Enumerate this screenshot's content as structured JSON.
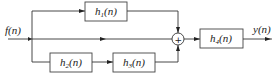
{
  "diagram": {
    "type": "block-diagram",
    "input": {
      "label": "f(n)",
      "name": "f",
      "arg": "(n)"
    },
    "output": {
      "label": "y(n)",
      "name": "y",
      "arg": "(n)"
    },
    "blocks": [
      {
        "id": "h1",
        "label": "h1(n)",
        "name": "h",
        "sub": "1",
        "arg": "(n)"
      },
      {
        "id": "h2",
        "label": "h2(n)",
        "name": "h",
        "sub": "2",
        "arg": "(n)"
      },
      {
        "id": "h3",
        "label": "h3(n)",
        "name": "h",
        "sub": "3",
        "arg": "(n)"
      },
      {
        "id": "h4",
        "label": "h4(n)",
        "name": "h",
        "sub": "4",
        "arg": "(n)"
      }
    ],
    "summer": {
      "symbol": "+"
    },
    "connections": [
      [
        "f(n)",
        "h1(n)"
      ],
      [
        "h1(n)",
        "sum"
      ],
      [
        "f(n)",
        "sum"
      ],
      [
        "f(n)",
        "h2(n)"
      ],
      [
        "h2(n)",
        "h3(n)"
      ],
      [
        "h3(n)",
        "sum"
      ],
      [
        "sum",
        "h4(n)"
      ],
      [
        "h4(n)",
        "y(n)"
      ]
    ]
  }
}
